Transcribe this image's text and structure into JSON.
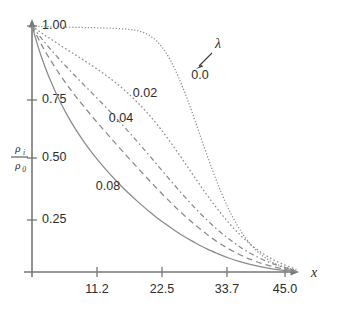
{
  "chart_data": {
    "type": "line",
    "title": "",
    "xlabel": "x",
    "ylabel": "rho_i / rho_0",
    "ylabel_numerator": "ρ",
    "ylabel_numerator_sub": "i",
    "ylabel_denominator": "ρ",
    "ylabel_denominator_sub": "0",
    "grid": false,
    "legend_position": "inline-annotations",
    "parameter_symbol": "λ",
    "xlim": [
      0,
      48.5
    ],
    "ylim": [
      0,
      1.06
    ],
    "xticks": [
      11.2,
      22.5,
      33.7,
      45.0
    ],
    "xticklabels": [
      "11.2",
      "22.5",
      "33.7",
      "45.0"
    ],
    "yticks": [
      0.25,
      0.5,
      0.75,
      1.0
    ],
    "yticklabels": [
      "0.25",
      "0.50",
      "0.75",
      "1.00"
    ],
    "series": [
      {
        "name": "0.0",
        "label": "0.0",
        "style": "fine-dotted",
        "color": "#8a8a8a",
        "x": [
          0,
          1.5,
          3,
          5,
          7,
          9,
          11,
          13,
          15,
          17,
          18.5,
          20,
          21.5,
          23,
          24.5,
          26,
          27.5,
          29,
          30.5,
          32,
          33.5,
          35,
          36.5,
          38,
          39.5,
          41,
          42.5,
          44,
          45.5,
          47
        ],
        "y": [
          1.0,
          0.998,
          0.997,
          0.996,
          0.995,
          0.994,
          0.993,
          0.992,
          0.99,
          0.987,
          0.982,
          0.972,
          0.952,
          0.918,
          0.866,
          0.795,
          0.71,
          0.615,
          0.516,
          0.42,
          0.332,
          0.255,
          0.19,
          0.138,
          0.097,
          0.066,
          0.043,
          0.027,
          0.016,
          0.008
        ]
      },
      {
        "name": "0.02",
        "label": "0.02",
        "style": "dotted",
        "color": "#8a8a8a",
        "x": [
          0,
          1.5,
          3,
          5,
          7,
          9,
          11,
          13,
          15,
          17,
          19,
          21,
          23,
          25,
          27,
          29,
          31,
          33,
          35,
          37,
          39,
          41,
          43,
          45,
          47
        ],
        "y": [
          1.0,
          0.975,
          0.952,
          0.922,
          0.893,
          0.864,
          0.834,
          0.802,
          0.767,
          0.728,
          0.684,
          0.634,
          0.578,
          0.516,
          0.45,
          0.383,
          0.317,
          0.256,
          0.2,
          0.151,
          0.11,
          0.076,
          0.049,
          0.028,
          0.011
        ]
      },
      {
        "name": "0.04",
        "label": "0.04",
        "style": "dash-dot",
        "color": "#8a8a8a",
        "x": [
          0,
          1.5,
          3,
          5,
          7,
          9,
          11,
          13,
          15,
          17,
          19,
          21,
          23,
          25,
          27,
          29,
          31,
          33,
          35,
          37,
          39,
          41,
          43,
          45,
          47
        ],
        "y": [
          1.0,
          0.955,
          0.913,
          0.862,
          0.813,
          0.766,
          0.72,
          0.673,
          0.625,
          0.575,
          0.523,
          0.47,
          0.416,
          0.362,
          0.31,
          0.26,
          0.214,
          0.172,
          0.135,
          0.102,
          0.074,
          0.051,
          0.032,
          0.018,
          0.007
        ]
      },
      {
        "name": "0.06",
        "label": "",
        "style": "dashed",
        "color": "#8a8a8a",
        "x": [
          0,
          1.5,
          3,
          5,
          7,
          9,
          11,
          13,
          15,
          17,
          19,
          21,
          23,
          25,
          27,
          29,
          31,
          33,
          35,
          37,
          39,
          41,
          43,
          45,
          47
        ],
        "y": [
          1.0,
          0.932,
          0.872,
          0.801,
          0.737,
          0.679,
          0.624,
          0.571,
          0.519,
          0.468,
          0.418,
          0.369,
          0.321,
          0.275,
          0.232,
          0.192,
          0.155,
          0.122,
          0.094,
          0.07,
          0.05,
          0.034,
          0.021,
          0.011,
          0.004
        ]
      },
      {
        "name": "0.08",
        "label": "0.08",
        "style": "solid",
        "color": "#8a8a8a",
        "x": [
          0,
          1.5,
          3,
          5,
          7,
          9,
          11,
          13,
          15,
          17,
          19,
          21,
          23,
          25,
          27,
          29,
          31,
          33,
          35,
          37,
          39,
          41,
          43,
          45,
          47
        ],
        "y": [
          1.0,
          0.886,
          0.794,
          0.692,
          0.608,
          0.537,
          0.475,
          0.42,
          0.37,
          0.324,
          0.282,
          0.243,
          0.207,
          0.175,
          0.145,
          0.119,
          0.095,
          0.075,
          0.057,
          0.042,
          0.03,
          0.02,
          0.012,
          0.006,
          0.002
        ]
      }
    ],
    "annotations": [
      {
        "text": "λ",
        "role": "parameter-symbol"
      },
      {
        "text": "0.0",
        "role": "series-label"
      },
      {
        "text": "0.02",
        "role": "series-label"
      },
      {
        "text": "0.04",
        "role": "series-label"
      },
      {
        "text": "0.08",
        "role": "series-label"
      }
    ]
  },
  "labels": {
    "y_1_00": "1.00",
    "y_0_75": "0.75",
    "y_0_50": "0.50",
    "y_0_25": "0.25",
    "x_11_2": "11.2",
    "x_22_5": "22.5",
    "x_33_7": "33.7",
    "x_45_0": "45.0",
    "x_axis_title": "x",
    "lambda": "λ",
    "curve_0_0": "0.0",
    "curve_0_02": "0.02",
    "curve_0_04": "0.04",
    "curve_0_08": "0.08",
    "rho_num": "ρ",
    "rho_num_sub": "i",
    "rho_den": "ρ",
    "rho_den_sub": "0"
  }
}
